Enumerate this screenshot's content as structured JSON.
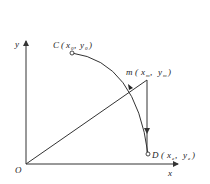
{
  "diagram": {
    "axes": {
      "x_label": "x",
      "y_label": "y",
      "origin_label": "O"
    },
    "points": {
      "C": {
        "name": "C",
        "x_var": "x",
        "x_sub": "0",
        "y_var": "y",
        "y_sub": "0"
      },
      "m": {
        "name": "m",
        "x_var": "x",
        "x_sub": "m",
        "y_var": "y",
        "y_sub": "m"
      },
      "D": {
        "name": "D",
        "x_var": "x",
        "x_sub": "e",
        "y_var": "y",
        "y_sub": "e"
      }
    },
    "colors": {
      "stroke": "#333333",
      "background": "#ffffff"
    }
  }
}
